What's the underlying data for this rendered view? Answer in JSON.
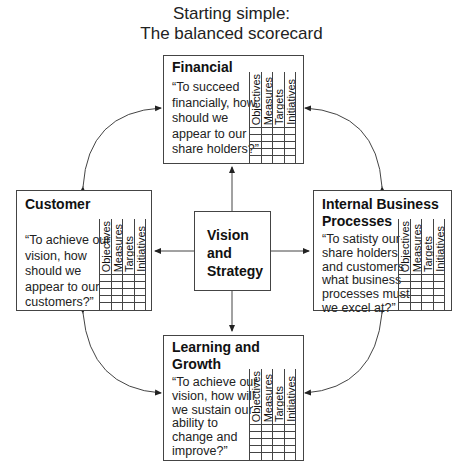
{
  "title": {
    "line1": "Starting simple:",
    "line2": "The balanced scorecard"
  },
  "grid_columns": [
    "Objectives",
    "Measures",
    "Targets",
    "Initiatives"
  ],
  "center": {
    "label": "Vision and Strategy",
    "lines": [
      "Vision",
      "and",
      "Strategy"
    ]
  },
  "perspectives": {
    "financial": {
      "heading_lines": [
        "Financial"
      ],
      "question_lines": [
        "“To succeed",
        "financially, how",
        "should we",
        "appear to our",
        "share holders?”"
      ]
    },
    "customer": {
      "heading_lines": [
        "Customer"
      ],
      "question_lines": [
        "“To achieve our",
        "vision, how",
        "should we",
        "appear to our",
        "customers?”"
      ]
    },
    "internal": {
      "heading_lines": [
        "Internal Business",
        "Processes"
      ],
      "question_lines": [
        "“To satisty our",
        "share holders",
        "and customers",
        "what business",
        "processes must",
        "we excel at?”"
      ]
    },
    "learning": {
      "heading_lines": [
        "Learning and",
        "Growth"
      ],
      "question_lines": [
        "“To achieve our",
        "vision, how will",
        "we sustain our",
        "ability to",
        "change and",
        "improve?”"
      ]
    }
  },
  "colors": {
    "stroke": "#444444",
    "text": "#111111",
    "background": "#ffffff"
  }
}
